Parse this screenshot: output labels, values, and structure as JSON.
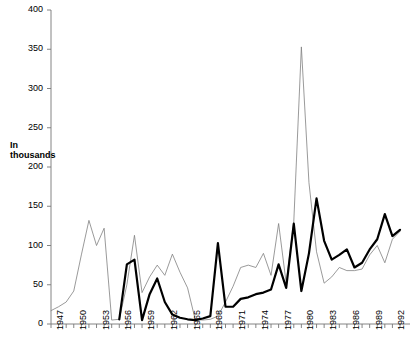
{
  "chart_data": {
    "type": "line",
    "title": "",
    "xlabel": "",
    "ylabel": "In thousands",
    "ylabel_lines": [
      "In",
      "thousands"
    ],
    "xlim": [
      1947,
      1993
    ],
    "ylim": [
      0,
      400
    ],
    "ytick_values": [
      0,
      50,
      100,
      150,
      200,
      250,
      300,
      350,
      400
    ],
    "ytick_labels": [
      "0",
      "50",
      "100",
      "150",
      "200",
      "250",
      "300",
      "350",
      "400"
    ],
    "xtick_values": [
      1947,
      1950,
      1953,
      1956,
      1959,
      1962,
      1965,
      1968,
      1971,
      1974,
      1977,
      1980,
      1983,
      1986,
      1989,
      1992
    ],
    "xtick_labels": [
      "1947",
      "1950",
      "1953",
      "1956",
      "1959",
      "1962",
      "1965",
      "1968",
      "1971",
      "1974",
      "1977",
      "1980",
      "1983",
      "1986",
      "1989",
      "1992"
    ],
    "grid": false,
    "legend": "none",
    "series": [
      {
        "name": "thin-series",
        "style": "thin",
        "color": "#808080",
        "width": 0.8,
        "x": [
          1947,
          1948,
          1949,
          1950,
          1951,
          1952,
          1953,
          1954,
          1955,
          1956,
          1957,
          1958,
          1959,
          1960,
          1961,
          1962,
          1963,
          1964,
          1965,
          1966,
          1967,
          1968,
          1969,
          1970,
          1971,
          1972,
          1973,
          1974,
          1975,
          1976,
          1977,
          1978,
          1979,
          1980,
          1981,
          1982,
          1983,
          1984,
          1985,
          1986,
          1987,
          1988,
          1989,
          1990,
          1991,
          1992,
          1993
        ],
        "y": [
          17,
          22,
          28,
          42,
          88,
          132,
          100,
          122,
          5,
          6,
          50,
          113,
          40,
          60,
          75,
          62,
          89,
          66,
          46,
          6,
          5,
          6,
          10,
          28,
          48,
          72,
          75,
          72,
          90,
          62,
          128,
          52,
          130,
          353,
          180,
          92,
          52,
          60,
          72,
          68,
          68,
          70,
          88,
          100,
          78,
          108,
          118
        ]
      },
      {
        "name": "thick-series",
        "style": "thick",
        "color": "#000000",
        "width": 2.2,
        "x": [
          1956,
          1957,
          1958,
          1959,
          1960,
          1961,
          1962,
          1963,
          1964,
          1965,
          1966,
          1967,
          1968,
          1969,
          1970,
          1971,
          1972,
          1973,
          1974,
          1975,
          1976,
          1977,
          1978,
          1979,
          1980,
          1981,
          1982,
          1983,
          1984,
          1985,
          1986,
          1987,
          1988,
          1989,
          1990,
          1991,
          1992,
          1993
        ],
        "y": [
          6,
          76,
          82,
          5,
          38,
          58,
          28,
          12,
          8,
          6,
          5,
          7,
          10,
          103,
          22,
          22,
          32,
          34,
          38,
          40,
          44,
          76,
          46,
          128,
          42,
          90,
          160,
          106,
          82,
          88,
          95,
          72,
          78,
          95,
          108,
          140,
          112,
          120
        ]
      }
    ]
  },
  "axis": {
    "ylabel_top": "In",
    "ylabel_bottom": "thousands"
  }
}
